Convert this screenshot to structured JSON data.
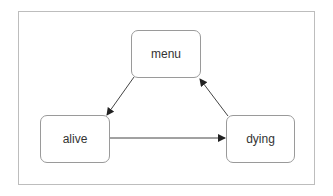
{
  "diagram": {
    "type": "state-diagram",
    "nodes": [
      {
        "id": "menu",
        "label": "menu"
      },
      {
        "id": "alive",
        "label": "alive"
      },
      {
        "id": "dying",
        "label": "dying"
      }
    ],
    "edges": [
      {
        "from": "menu",
        "to": "alive"
      },
      {
        "from": "alive",
        "to": "dying"
      },
      {
        "from": "dying",
        "to": "menu"
      }
    ],
    "colors": {
      "frame_border": "#bdbdbd",
      "node_border": "#9a9a9a",
      "edge": "#333333",
      "text": "#333333"
    }
  }
}
